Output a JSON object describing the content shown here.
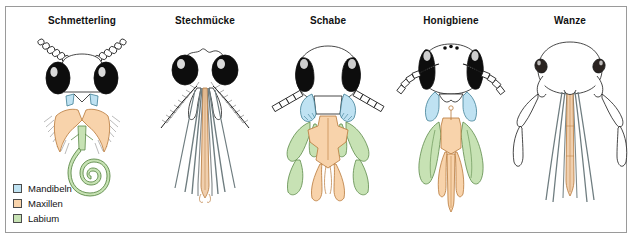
{
  "figure": {
    "background": "#ffffff",
    "border_color": "#9a9a9a"
  },
  "colors": {
    "mandibeln": "#bfe2f2",
    "mandibeln_stroke": "#3f7f96",
    "maxillen": "#f8d3ab",
    "maxillen_stroke": "#b8783a",
    "labium": "#c7e2b4",
    "labium_stroke": "#5d8a4a",
    "eye_dark": "#0d0d0d",
    "outline": "#1a1a1a",
    "hair_gray": "#8d8d8d",
    "stylet_gray": "#6f7d80"
  },
  "panels": [
    {
      "id": "schmetterling",
      "label": "Schmetterling",
      "x": 22,
      "features": "beaded clubbed antennae, large black compound eyes, small blue mandibles, orange hairy labial palps, long green coiled proboscis"
    },
    {
      "id": "stechmuecke",
      "label": "Stechmücke",
      "x": 145,
      "features": "plumose feathery antennae, black compound eyes, long needle-like stylet bundle, orange labium sheath, slender maxillary palps"
    },
    {
      "id": "schabe",
      "label": "Schabe",
      "x": 268,
      "features": "segmented filiform antennae, black kidney eyes, blue toothed mandibles, orange labium with palps, green maxillary palps"
    },
    {
      "id": "honigbiene",
      "label": "Honigbiene",
      "x": 391,
      "features": "three ocelli, elbowed antennae, black compound eyes, blue mandibles, green galeae, orange glossa tongue and labial palps"
    },
    {
      "id": "wanze",
      "label": "Wanze",
      "x": 510,
      "features": "pale outlined head, small dark eyes, long four-segmented antennae, piercing rostrum with orange stylet bundle"
    }
  ],
  "legend": {
    "items": [
      {
        "label": "Mandibeln",
        "swatch": "#bfe2f2",
        "stroke": "#4b4b4b"
      },
      {
        "label": "Maxillen",
        "swatch": "#f8d3ab",
        "stroke": "#4b4b4b"
      },
      {
        "label": "Labium",
        "swatch": "#c7e2b4",
        "stroke": "#4b4b4b"
      }
    ]
  }
}
